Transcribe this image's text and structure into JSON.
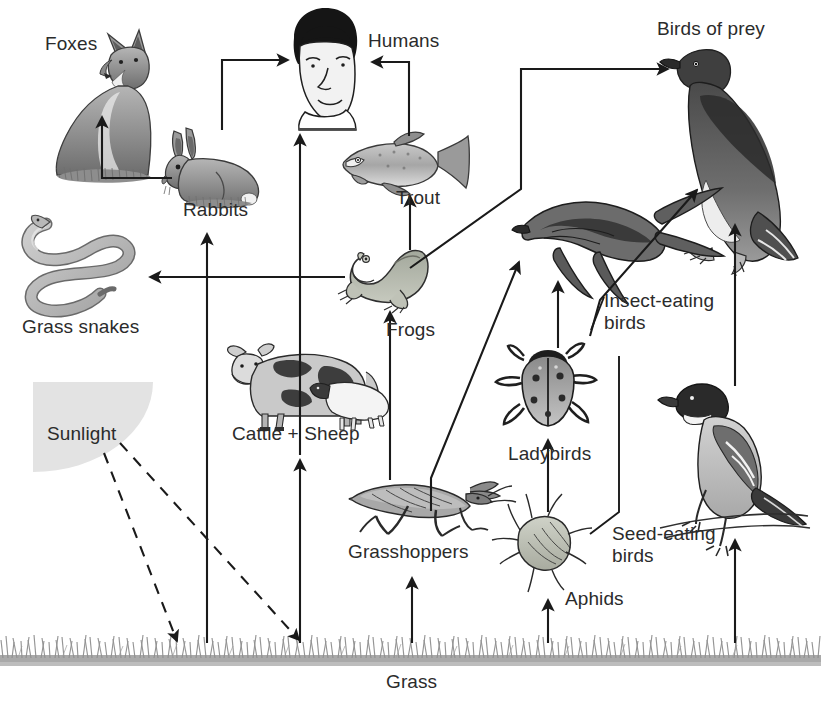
{
  "diagram": {
    "title_text": "",
    "background_color": "#ffffff",
    "ink_color": "#1a1a1a",
    "sunlight_color": "#e3e3e3",
    "grass_color": "#8f8f8f"
  },
  "labels": {
    "foxes": "Foxes",
    "humans": "Humans",
    "birds_of_prey": "Birds of prey",
    "rabbits": "Rabbits",
    "trout": "Trout",
    "grass_snakes": "Grass snakes",
    "frogs": "Frogs",
    "insect_eating_birds": "Insect-eating\nbirds",
    "ladybirds": "Ladybirds",
    "cattle_sheep": "Cattle + Sheep",
    "sunlight": "Sunlight",
    "grasshoppers": "Grasshoppers",
    "seed_eating_birds": "Seed-eating\nbirds",
    "aphids": "Aphids",
    "grass": "Grass"
  },
  "organisms": [
    {
      "name": "foxes",
      "label": "Foxes",
      "trophic_role": "predator"
    },
    {
      "name": "humans",
      "label": "Humans",
      "trophic_role": "omnivore"
    },
    {
      "name": "birds-of-prey",
      "label": "Birds of prey",
      "trophic_role": "top-predator"
    },
    {
      "name": "rabbits",
      "label": "Rabbits",
      "trophic_role": "herbivore"
    },
    {
      "name": "trout",
      "label": "Trout",
      "trophic_role": "carnivore"
    },
    {
      "name": "grass-snakes",
      "label": "Grass snakes",
      "trophic_role": "predator"
    },
    {
      "name": "frogs",
      "label": "Frogs",
      "trophic_role": "carnivore"
    },
    {
      "name": "insect-eating-birds",
      "label": "Insect-eating birds",
      "trophic_role": "insectivore"
    },
    {
      "name": "ladybirds",
      "label": "Ladybirds",
      "trophic_role": "predator"
    },
    {
      "name": "cattle-sheep",
      "label": "Cattle + Sheep",
      "trophic_role": "herbivore"
    },
    {
      "name": "grasshoppers",
      "label": "Grasshoppers",
      "trophic_role": "herbivore"
    },
    {
      "name": "seed-eating-birds",
      "label": "Seed-eating birds",
      "trophic_role": "granivore"
    },
    {
      "name": "aphids",
      "label": "Aphids",
      "trophic_role": "herbivore"
    },
    {
      "name": "grass",
      "label": "Grass",
      "trophic_role": "producer"
    },
    {
      "name": "sunlight",
      "label": "Sunlight",
      "trophic_role": "energy-source"
    }
  ],
  "energy_flows": [
    {
      "from": "Sunlight",
      "to": "Grass",
      "style": "dashed"
    },
    {
      "from": "Grass",
      "to": "Rabbits",
      "style": "solid"
    },
    {
      "from": "Grass",
      "to": "Cattle + Sheep",
      "style": "solid"
    },
    {
      "from": "Grass",
      "to": "Humans",
      "style": "solid"
    },
    {
      "from": "Grass",
      "to": "Grasshoppers",
      "style": "solid"
    },
    {
      "from": "Grass",
      "to": "Aphids",
      "style": "solid"
    },
    {
      "from": "Grass",
      "to": "Seed-eating birds",
      "style": "solid"
    },
    {
      "from": "Rabbits",
      "to": "Foxes",
      "style": "solid"
    },
    {
      "from": "Rabbits",
      "to": "Humans",
      "style": "solid"
    },
    {
      "from": "Cattle + Sheep",
      "to": "Humans",
      "style": "solid"
    },
    {
      "from": "Trout",
      "to": "Humans",
      "style": "solid"
    },
    {
      "from": "Frogs",
      "to": "Trout",
      "style": "solid"
    },
    {
      "from": "Frogs",
      "to": "Grass snakes",
      "style": "solid"
    },
    {
      "from": "Frogs",
      "to": "Birds of prey",
      "style": "solid"
    },
    {
      "from": "Grasshoppers",
      "to": "Frogs",
      "style": "solid"
    },
    {
      "from": "Grasshoppers",
      "to": "Insect-eating birds",
      "style": "solid"
    },
    {
      "from": "Aphids",
      "to": "Ladybirds",
      "style": "solid"
    },
    {
      "from": "Aphids",
      "to": "Seed-eating birds",
      "style": "solid"
    },
    {
      "from": "Ladybirds",
      "to": "Insect-eating birds",
      "style": "solid"
    },
    {
      "from": "Insect-eating birds",
      "to": "Birds of prey",
      "style": "solid"
    },
    {
      "from": "Seed-eating birds",
      "to": "Birds of prey",
      "style": "solid"
    }
  ]
}
